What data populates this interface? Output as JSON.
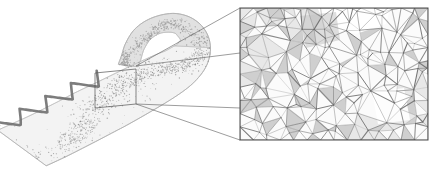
{
  "figure": {
    "type": "scientific-illustration",
    "background_color": "#ffffff",
    "caption": "",
    "panels": [
      {
        "id": "overview",
        "name": "overview-panel",
        "label": "",
        "description": "Folded ribbon-like surface carrying a dense triangulated point cloud, shown in oblique 3D perspective",
        "bounds": {
          "x": 0,
          "y": 0,
          "width": 230,
          "height": 176
        }
      },
      {
        "id": "detail",
        "name": "detail-panel",
        "label": "",
        "description": "Magnified view of the boxed region showing the individual triangulated mesh edges",
        "bounds": {
          "x": 240,
          "y": 8,
          "width": 188,
          "height": 132
        },
        "border_color": "#4a4a4a",
        "border_width": 1,
        "fill_color": "#ffffff"
      }
    ],
    "highlight_box": {
      "name": "region-of-interest-box",
      "x": 95,
      "y": 69,
      "width": 41,
      "height": 35,
      "skew_top": -4,
      "stroke_color": "#555555",
      "stroke_width": 0.7,
      "fill": "none"
    },
    "connectors": {
      "name": "zoom-connector-lines",
      "stroke_color": "#5a5a5a",
      "stroke_width": 0.6,
      "lines": [
        {
          "x1": 136,
          "y1": 66,
          "x2": 240,
          "y2": 8
        },
        {
          "x1": 136,
          "y1": 66,
          "x2": 240,
          "y2": 53
        },
        {
          "x1": 136,
          "y1": 104,
          "x2": 240,
          "y2": 108
        },
        {
          "x1": 136,
          "y1": 104,
          "x2": 240,
          "y2": 140
        }
      ]
    },
    "ribbon": {
      "name": "folded-ribbon-surface",
      "surface_fill": "#f2f2f2",
      "surface_edge": "#c9c9c9",
      "fold_fill": "#dcdcdc",
      "fold_edge": "#bdbdbd",
      "opacity": 0.9
    },
    "point_cloud": {
      "name": "scattered-point-cloud",
      "point_count": 2600,
      "point_color": "#8a8a8a",
      "point_radius": 0.45,
      "density_description": "dense along the central band of the ribbon, sparse near edges"
    },
    "wave": {
      "name": "boundary-zigzag-curve",
      "stroke_color": "#6b6b6b",
      "stroke_width": 2.6,
      "peaks": 4,
      "amplitude": 9,
      "description": "dark zigzag / triangular-wave curve tracing the lower free boundary of the ribbon"
    },
    "mesh": {
      "name": "triangulated-mesh-detail",
      "node_count": 190,
      "edge_color": "#6d6d6d",
      "edge_width": 0.55,
      "face_fill_light": "#fbfbfb",
      "face_fill_mid": "#e8e8e8",
      "face_fill_dark": "#cfcfcf",
      "shaded_patch_color": "#c4c4c4",
      "shaded_patch_label": "",
      "description": "irregular Delaunay-like triangulation with locally refined regions and a light gray shaded patch in the upper right"
    }
  },
  "chart_data": {
    "type": "scatter",
    "title": "",
    "xlabel": "",
    "ylabel": "",
    "series": [
      {
        "name": "surface-points",
        "count": 2600
      },
      {
        "name": "mesh-edges",
        "count": 560
      }
    ],
    "legend": [],
    "grid": false
  }
}
